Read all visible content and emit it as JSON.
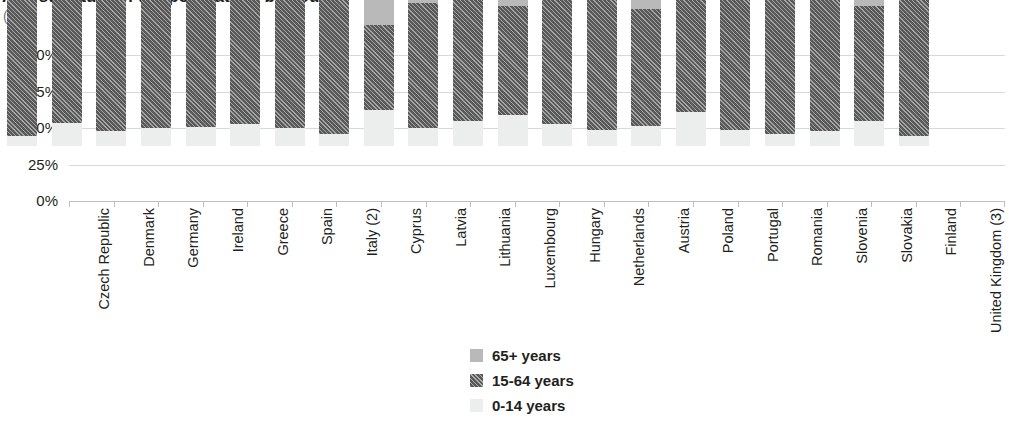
{
  "chart_title": "Age structure of the population, by country",
  "unit_label": "(%)",
  "legend": {
    "items": [
      {
        "label": "65+ years",
        "key": "s65",
        "color": "#b9b9b9"
      },
      {
        "label": "15-64 years",
        "key": "s1564",
        "color": "#595959"
      },
      {
        "label": "0-14 years",
        "key": "s014",
        "color": "#eceded"
      }
    ]
  },
  "chart_data": {
    "type": "bar",
    "stacked": true,
    "normalized": true,
    "title": "Age structure of the population, by country",
    "xlabel": "",
    "ylabel": "(%)",
    "ylim": [
      0,
      100
    ],
    "yticks": [
      "0%",
      "25%",
      "50%",
      "75%",
      "100%"
    ],
    "ytick_values": [
      0,
      25,
      50,
      75,
      100
    ],
    "grid": true,
    "legend_position": "bottom-center",
    "categories": [
      "Czech Republic",
      "Denmark",
      "Germany",
      "Ireland",
      "Greece",
      "Spain",
      "Italy (2)",
      "Cyprus",
      "Latvia",
      "Lithuania",
      "Luxembourg",
      "Hungary",
      "Netherlands",
      "Austria",
      "Poland",
      "Portugal",
      "Romania",
      "Slovenia",
      "Slovakia",
      "Finland",
      "United Kingdom (3)"
    ],
    "series": [
      {
        "name": "0-14 years",
        "color": "#eceded",
        "values": [
          7,
          16,
          10,
          12,
          13,
          15,
          12,
          8,
          25,
          12,
          17,
          21,
          15,
          11,
          14,
          23,
          11,
          8,
          10,
          17,
          7
        ]
      },
      {
        "name": "15-64 years",
        "color": "#595959",
        "values": [
          93,
          84,
          90,
          88,
          87,
          85,
          88,
          92,
          58,
          86,
          83,
          75,
          85,
          89,
          80,
          77,
          89,
          92,
          90,
          79,
          93
        ]
      },
      {
        "name": "65+ years",
        "color": "#b9b9b9",
        "values": [
          0,
          0,
          0,
          0,
          0,
          0,
          0,
          0,
          17,
          2,
          0,
          4,
          0,
          0,
          6,
          0,
          0,
          0,
          0,
          4,
          0
        ]
      }
    ]
  }
}
